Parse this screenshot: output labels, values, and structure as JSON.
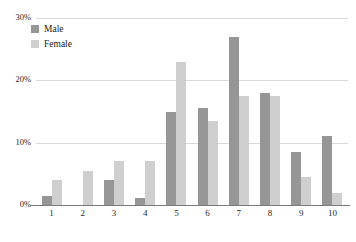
{
  "chart_data": {
    "type": "bar",
    "title": "",
    "xlabel": "",
    "ylabel": "",
    "categories": [
      "1",
      "2",
      "3",
      "4",
      "5",
      "6",
      "7",
      "8",
      "9",
      "10"
    ],
    "series": [
      {
        "name": "Male",
        "color": "#969696",
        "values": [
          1.5,
          0,
          4.0,
          1.2,
          15.0,
          15.5,
          27.0,
          18.0,
          8.5,
          11.0
        ]
      },
      {
        "name": "Female",
        "color": "#cfcfcf",
        "values": [
          4.0,
          5.5,
          7.0,
          7.0,
          23.0,
          13.5,
          17.5,
          17.5,
          4.5,
          2.0
        ]
      }
    ],
    "ylim": [
      0,
      30
    ],
    "yticks": [
      0,
      10,
      20,
      30
    ],
    "ytick_labels": [
      "0%",
      "10%",
      "20%",
      "30%"
    ],
    "grid": true,
    "grid_color": "#d9d9d9",
    "legend_position": "top-left",
    "axis_color": "#7a7a7a"
  },
  "legend": {
    "items": [
      {
        "label": "Male",
        "swatch": "male-swatch"
      },
      {
        "label": "Female",
        "swatch": "female-swatch"
      }
    ]
  }
}
